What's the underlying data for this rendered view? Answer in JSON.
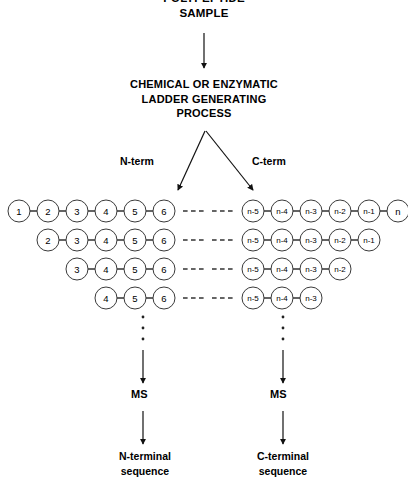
{
  "diagram": {
    "title_lines": [
      "POLYPEPTIDE",
      "SAMPLE"
    ],
    "process_lines": [
      "CHEMICAL OR ENZYMATIC",
      "LADDER GENERATING",
      "PROCESS"
    ],
    "branch_labels": {
      "left": "N-term",
      "right": "C-term"
    },
    "ms_labels": {
      "left": "MS",
      "right": "MS"
    },
    "result_labels": {
      "left": [
        "N-terminal",
        "sequence"
      ],
      "right": [
        "C-terminal",
        "sequence"
      ]
    },
    "ellipsis_glyph": "- - -",
    "vertical_ellipsis_dots": 3,
    "colors": {
      "ink": "#000000",
      "circle_stroke": "#3a3a3a",
      "bond": "#111111",
      "background": "#ffffff"
    }
  },
  "ladders": {
    "left": {
      "name": "N-terminal ladder",
      "dash_side": "right",
      "rows": [
        {
          "labels": [
            "1",
            "2",
            "3",
            "4",
            "5",
            "6"
          ]
        },
        {
          "labels": [
            "2",
            "3",
            "4",
            "5",
            "6"
          ]
        },
        {
          "labels": [
            "3",
            "4",
            "5",
            "6"
          ]
        },
        {
          "labels": [
            "4",
            "5",
            "6"
          ]
        }
      ]
    },
    "right": {
      "name": "C-terminal ladder",
      "dash_side": "left",
      "rows": [
        {
          "labels": [
            "n-5",
            "n-4",
            "n-3",
            "n-2",
            "n-1",
            "n"
          ]
        },
        {
          "labels": [
            "n-5",
            "n-4",
            "n-3",
            "n-2",
            "n-1"
          ]
        },
        {
          "labels": [
            "n-5",
            "n-4",
            "n-3",
            "n-2"
          ]
        },
        {
          "labels": [
            "n-5",
            "n-4",
            "n-3"
          ]
        }
      ]
    }
  },
  "geometry": {
    "row_y": [
      211,
      240,
      269,
      298
    ],
    "left_last_cx": 164,
    "right_first_cx": 253,
    "spacing": 29,
    "radius": 11,
    "left_axis_x": 143,
    "right_axis_x": 283
  }
}
